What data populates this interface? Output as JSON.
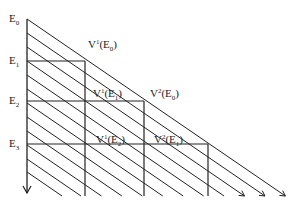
{
  "diagram": {
    "type": "filtration-spectral-diagram",
    "axis_labels": [
      {
        "base": "E",
        "sub": "0",
        "y": 19
      },
      {
        "base": "E",
        "sub": "1",
        "y": 61
      },
      {
        "base": "E",
        "sub": "2",
        "y": 101
      },
      {
        "base": "E",
        "sub": "3",
        "y": 144
      }
    ],
    "cell_labels": [
      {
        "base": "V",
        "sup": "1",
        "arg": "E",
        "argsub": "0",
        "x": 88,
        "y": 48
      },
      {
        "base": "V",
        "sup": "1",
        "arg": "E",
        "argsub": "1",
        "x": 93,
        "y": 97
      },
      {
        "base": "V",
        "sup": "2",
        "arg": "E",
        "argsub": "0",
        "x": 150,
        "y": 97
      },
      {
        "base": "V",
        "sup": "1",
        "arg": "E",
        "argsub": "2",
        "x": 96,
        "y": 143
      },
      {
        "base": "V",
        "sup": "2",
        "arg": "E",
        "argsub": "1",
        "x": 154,
        "y": 143
      }
    ],
    "axis": {
      "x": 27,
      "top": 19,
      "bottom": 193
    },
    "rows": [
      {
        "y": 61,
        "x_end": 85
      },
      {
        "y": 101,
        "x_end": 144
      },
      {
        "y": 144,
        "x_end": 208
      }
    ],
    "verticals": [
      {
        "x": 85,
        "top": 61,
        "bottom": 196
      },
      {
        "x": 144,
        "top": 101,
        "bottom": 196
      },
      {
        "x": 208,
        "top": 144,
        "bottom": 196
      }
    ],
    "diagonals": {
      "starts_y": [
        19,
        33,
        47,
        61,
        75,
        89,
        103,
        117,
        131,
        145,
        159,
        172
      ],
      "slope": 0.685,
      "bottom_y": 196,
      "arrow_count": 3
    },
    "stroke_color": "#222222"
  }
}
